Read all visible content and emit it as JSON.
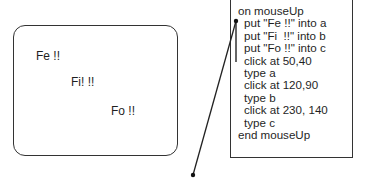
{
  "card": {
    "fields": [
      {
        "text": "Fe !!"
      },
      {
        "text": "Fi! !!"
      },
      {
        "text": "Fo !!"
      }
    ]
  },
  "script": {
    "lines": [
      {
        "text": "on mouseUp",
        "indent": false
      },
      {
        "text": "put \"Fe !!\" into a",
        "indent": true
      },
      {
        "text": "put \"Fi  !!\" into b",
        "indent": true
      },
      {
        "text": "put \"Fo !!\" into c",
        "indent": true
      },
      {
        "text": "click at 50,40",
        "indent": true
      },
      {
        "text": "type a",
        "indent": true
      },
      {
        "text": "click at 120,90",
        "indent": true
      },
      {
        "text": "type b",
        "indent": true
      },
      {
        "text": "click at 230, 140",
        "indent": true
      },
      {
        "text": "type c",
        "indent": true
      },
      {
        "text": "end mouseUp",
        "indent": false
      }
    ]
  },
  "colors": {
    "stroke": "#333333",
    "text": "#1f1f1f",
    "background": "#ffffff"
  }
}
